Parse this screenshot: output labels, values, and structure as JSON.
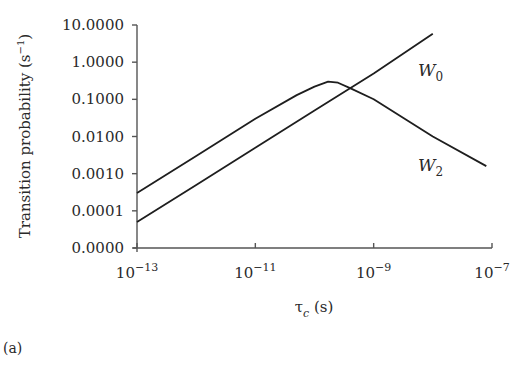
{
  "chart_data": {
    "type": "line",
    "title": "",
    "xlabel": "τc (s)",
    "ylabel": "Transition probability (s⁻¹)",
    "xscale": "log",
    "yscale": "log",
    "xlim": [
      1e-13,
      1e-07
    ],
    "ylim": [
      1e-05,
      10
    ],
    "x_ticks": [
      {
        "value": 1e-13,
        "base": "10",
        "exp": "−13"
      },
      {
        "value": 1e-11,
        "base": "10",
        "exp": "−11"
      },
      {
        "value": 1e-09,
        "base": "10",
        "exp": "−9"
      },
      {
        "value": 1e-07,
        "base": "10",
        "exp": "−7"
      }
    ],
    "y_ticks": [
      {
        "value": 10,
        "label": "10.0000"
      },
      {
        "value": 1,
        "label": "1.0000"
      },
      {
        "value": 0.1,
        "label": "0.1000"
      },
      {
        "value": 0.01,
        "label": "0.0100"
      },
      {
        "value": 0.001,
        "label": "0.0010"
      },
      {
        "value": 0.0001,
        "label": "0.0001"
      },
      {
        "value": 1e-05,
        "label": "0.0000"
      }
    ],
    "grid": false,
    "legend": "inline labels near line ends",
    "series": [
      {
        "name": "W0",
        "label_main": "W",
        "label_sub": "0",
        "x": [
          1e-13,
          1e-12,
          1e-11,
          1e-10,
          1e-09,
          1e-08
        ],
        "y": [
          5e-05,
          0.0005,
          0.005,
          0.05,
          0.5,
          5.8
        ]
      },
      {
        "name": "W2",
        "label_main": "W",
        "label_sub": "2",
        "x": [
          1e-13,
          1e-12,
          1e-11,
          5e-11,
          1e-10,
          1.7e-10,
          2.5e-10,
          4e-10,
          1e-09,
          1e-08,
          8e-08
        ],
        "y": [
          0.0003,
          0.003,
          0.03,
          0.13,
          0.22,
          0.3,
          0.28,
          0.2,
          0.1,
          0.01,
          0.0016
        ]
      }
    ]
  },
  "labels": {
    "ylabel": "Transition probability (s",
    "ylabel_sup": "−1",
    "ylabel_close": ")",
    "xlabel_tau": "τ",
    "xlabel_sub": "c",
    "xlabel_unit": " (s)",
    "panel": "(a)"
  },
  "style": {
    "line_color": "#1e1e1e",
    "axis_color": "#555555",
    "background": "#ffffff"
  }
}
